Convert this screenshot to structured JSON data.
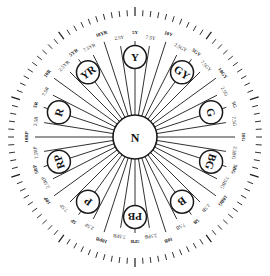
{
  "diagram": {
    "type": "munsell-hue-circle",
    "center": {
      "label": "N"
    },
    "hue_steps": [
      "5Y",
      "7.5Y",
      "10Y",
      "2.5GY",
      "5GY",
      "7.5GY",
      "10GY",
      "2.5G",
      "5G",
      "7.5G",
      "10G",
      "2.5BG",
      "5BG",
      "7.5BG",
      "10BG",
      "2.5B",
      "5B",
      "7.5B",
      "10B",
      "2.5PB",
      "5PB",
      "7.5PB",
      "10PB",
      "2.5P",
      "5P",
      "7.5P",
      "10P",
      "2.5RP",
      "5RP",
      "7.5RP",
      "10RP",
      "2.5R",
      "5R",
      "7.5R",
      "10R",
      "2.5YR",
      "5YR",
      "7.5YR",
      "10YR",
      "2.5Y"
    ],
    "principal_hues": [
      "Y",
      "GY",
      "G",
      "BG",
      "B",
      "PB",
      "P",
      "RP",
      "R",
      "YR"
    ],
    "tick_count": 100,
    "colors": {
      "line": "#1a1a1a",
      "background": "#ffffff"
    }
  }
}
